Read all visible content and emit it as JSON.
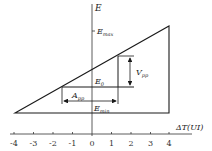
{
  "diagram": {
    "y_axis_label": "E",
    "x_axis_label": "ΔT(UI)",
    "x_ticks": [
      "-4",
      "-3",
      "-2",
      "-1",
      "0",
      "1",
      "2",
      "3",
      "4"
    ],
    "labels": {
      "e_max": {
        "main": "E",
        "sub": "max"
      },
      "e_0": {
        "main": "E",
        "sub": "0"
      },
      "e_min": {
        "main": "E",
        "sub": "min"
      },
      "v_pp": {
        "main": "V",
        "sub": "pp"
      },
      "a_pp": {
        "main": "A",
        "sub": "pp"
      }
    },
    "line_color": "#1a1a1a"
  }
}
